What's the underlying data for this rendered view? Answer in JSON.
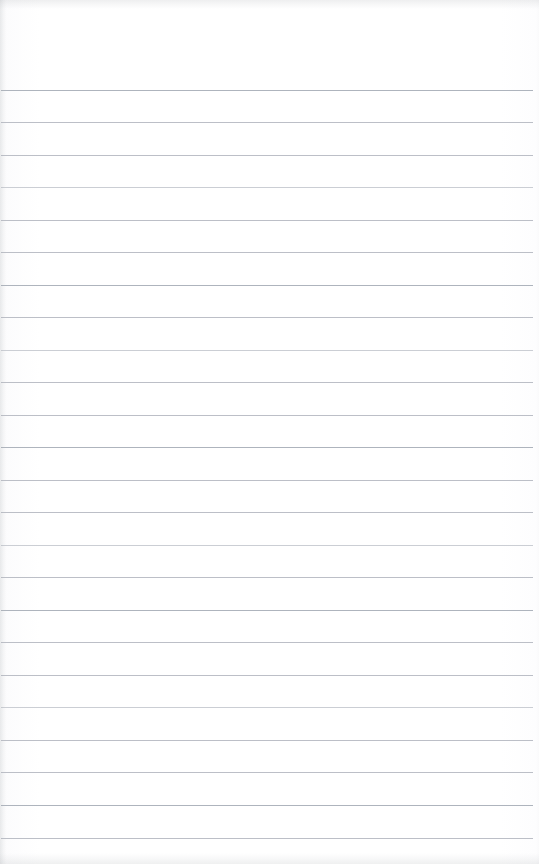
{
  "document": {
    "kind": "scanned-ruled-notebook-page",
    "title": "Blank ruled notebook page",
    "page_text": "",
    "visible_text_content": "",
    "width_px": 539,
    "height_px": 864
  },
  "paper": {
    "background_color": "#fdfdfe",
    "edge_tint_color": "#f4f5f6"
  },
  "ruling": {
    "line_color": "#b6bac2",
    "line_color_light": "#c2c6cd",
    "line_color_dark": "#aab0b9",
    "line_thickness_px": 1,
    "line_spacing_px": 32.4,
    "first_line_y_px": 90,
    "line_start_x_px": 1,
    "line_end_x_px": 533,
    "line_count": 24,
    "lines": [
      {
        "index": 1,
        "y": 90,
        "tone": "dark"
      },
      {
        "index": 2,
        "y": 122,
        "tone": "normal"
      },
      {
        "index": 3,
        "y": 155,
        "tone": "normal"
      },
      {
        "index": 4,
        "y": 187,
        "tone": "faint"
      },
      {
        "index": 5,
        "y": 220,
        "tone": "normal"
      },
      {
        "index": 6,
        "y": 252,
        "tone": "normal"
      },
      {
        "index": 7,
        "y": 285,
        "tone": "dark"
      },
      {
        "index": 8,
        "y": 317,
        "tone": "normal"
      },
      {
        "index": 9,
        "y": 350,
        "tone": "faint"
      },
      {
        "index": 10,
        "y": 382,
        "tone": "normal"
      },
      {
        "index": 11,
        "y": 415,
        "tone": "normal"
      },
      {
        "index": 12,
        "y": 447,
        "tone": "dark"
      },
      {
        "index": 13,
        "y": 480,
        "tone": "normal"
      },
      {
        "index": 14,
        "y": 512,
        "tone": "normal"
      },
      {
        "index": 15,
        "y": 545,
        "tone": "faint"
      },
      {
        "index": 16,
        "y": 577,
        "tone": "normal"
      },
      {
        "index": 17,
        "y": 610,
        "tone": "dark"
      },
      {
        "index": 18,
        "y": 642,
        "tone": "normal"
      },
      {
        "index": 19,
        "y": 675,
        "tone": "normal"
      },
      {
        "index": 20,
        "y": 707,
        "tone": "faint"
      },
      {
        "index": 21,
        "y": 740,
        "tone": "normal"
      },
      {
        "index": 22,
        "y": 772,
        "tone": "normal"
      },
      {
        "index": 23,
        "y": 805,
        "tone": "dark"
      },
      {
        "index": 24,
        "y": 838,
        "tone": "normal"
      }
    ]
  },
  "scan_artifacts": {
    "top_band_height_px": 9,
    "bottom_band_height_px": 11,
    "left_edge_width_px": 7,
    "artifact_color": "#96999e"
  }
}
